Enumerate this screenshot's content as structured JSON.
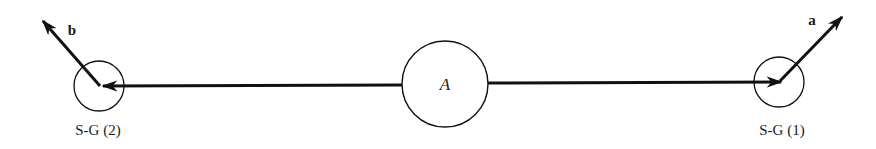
{
  "diagram": {
    "center_node": {
      "label": "A"
    },
    "left_node": {
      "label": "S-G (2)"
    },
    "right_node": {
      "label": "S-G (1)"
    },
    "vectors": {
      "left": {
        "label": "b"
      },
      "right": {
        "label": "a"
      }
    },
    "colors": {
      "stroke": "#111111",
      "background": "#ffffff"
    }
  }
}
